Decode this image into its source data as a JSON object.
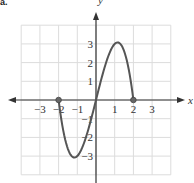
{
  "figure_label": "a.",
  "chart_data": {
    "type": "line",
    "title": "",
    "xlabel": "x",
    "ylabel": "y",
    "xlim": [
      -4,
      4
    ],
    "ylim": [
      -4,
      4
    ],
    "grid": true,
    "x_ticks": [
      -3,
      -2,
      -1,
      1,
      2,
      3
    ],
    "x_tick_labels": [
      "−3",
      "−2",
      "−1",
      "1",
      "2",
      "3"
    ],
    "y_ticks": [
      3,
      2,
      1,
      -1,
      -2,
      -3
    ],
    "y_tick_labels": [
      "3",
      "2",
      "1",
      "−1",
      "−2",
      "−3"
    ],
    "function": "f(x) = x(4 − x²), domain [−2, 2]",
    "domain": [
      -2,
      2
    ],
    "endpoints": [
      {
        "x": -2,
        "y": 0,
        "marker": "closed-dot"
      },
      {
        "x": 2,
        "y": 0,
        "marker": "closed-dot"
      }
    ],
    "extrema": [
      {
        "type": "min",
        "x": -1.15,
        "y": -3.08
      },
      {
        "type": "max",
        "x": 1.15,
        "y": 3.08
      }
    ],
    "series": [
      {
        "name": "f(x)",
        "x": [
          -2,
          -1.75,
          -1.5,
          -1.25,
          -1.15,
          -1,
          -0.75,
          -0.5,
          -0.25,
          0,
          0.25,
          0.5,
          0.75,
          1,
          1.15,
          1.25,
          1.5,
          1.75,
          2
        ],
        "y": [
          0,
          -1.64,
          -2.63,
          -3.05,
          -3.08,
          -3,
          -2.58,
          -1.88,
          -0.98,
          0,
          0.98,
          1.88,
          2.58,
          3,
          3.08,
          3.05,
          2.63,
          1.64,
          0
        ]
      }
    ],
    "colors": {
      "curve": "#555555",
      "axes": "#333333",
      "grid": "#dcdcdc"
    }
  }
}
